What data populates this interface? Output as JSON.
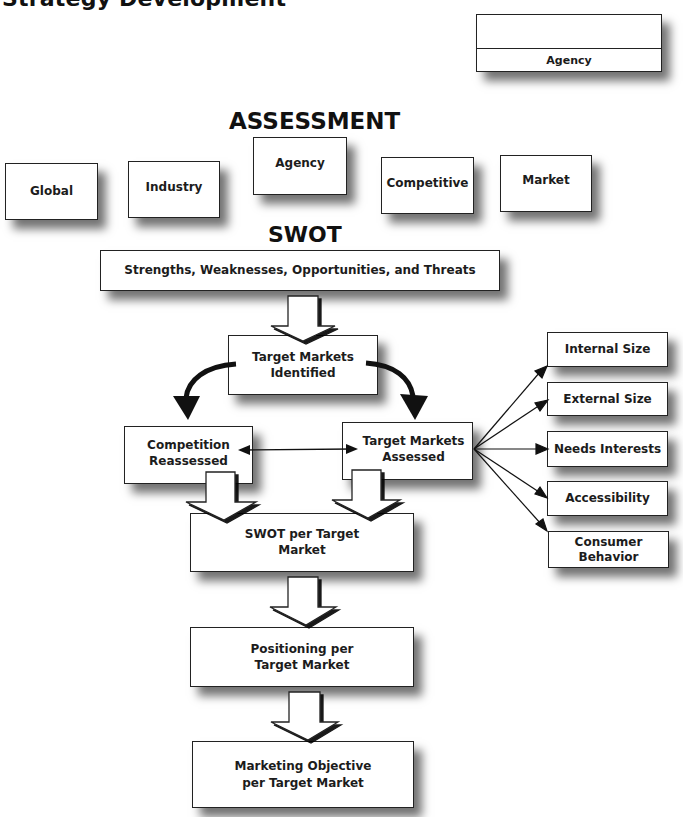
{
  "page_title": "Strategy Development",
  "legend": {
    "label": "Agency"
  },
  "assessment": {
    "heading": "ASSESSMENT",
    "boxes": [
      {
        "label": "Global"
      },
      {
        "label": "Industry"
      },
      {
        "label": "Agency"
      },
      {
        "label": "Competitive"
      },
      {
        "label": "Market"
      }
    ]
  },
  "swot": {
    "heading": "SWOT",
    "bar_label": "Strengths, Weaknesses, Opportunities, and Threats"
  },
  "flow": {
    "target_markets_identified": "Target Markets\nIdentified",
    "competition_reassessed": "Competition\nReassessed",
    "target_markets_assessed": "Target Markets\nAssessed",
    "swot_per_target_market": "SWOT per Target\nMarket",
    "positioning_per_target_market": "Positioning per\nTarget Market",
    "marketing_objective": "Marketing Objective\nper Target Market"
  },
  "assessment_factors": [
    {
      "label": "Internal Size"
    },
    {
      "label": "External Size"
    },
    {
      "label": "Needs Interests"
    },
    {
      "label": "Accessibility"
    },
    {
      "label": "Consumer\nBehavior"
    }
  ],
  "icons": {
    "block_arrow": "block-arrow-down-icon",
    "curved_arrow": "curved-arrow-icon",
    "bidirectional_arrow": "double-headed-arrow-icon",
    "fan_arrow": "arrow-right-icon"
  }
}
